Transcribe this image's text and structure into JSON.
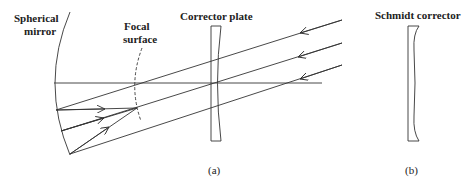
{
  "labels": {
    "spherical_mirror_line1": "Spherical",
    "spherical_mirror_line2": "mirror",
    "focal_surface_line1": "Focal",
    "focal_surface_line2": "surface",
    "corrector_plate": "Corrector plate",
    "schmidt_corrector": "Schmidt corrector",
    "panel_a": "(a)",
    "panel_b": "(b)"
  },
  "colors": {
    "stroke": "#333333",
    "background": "#ffffff"
  }
}
